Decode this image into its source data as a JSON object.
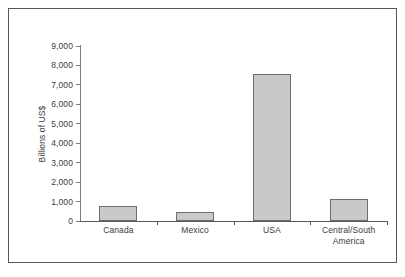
{
  "chart_data": {
    "type": "bar",
    "title": "",
    "xlabel": "",
    "ylabel": "Billions of US$",
    "categories": [
      "Canada",
      "Mexico",
      "USA",
      "Central/South America"
    ],
    "values": [
      770,
      450,
      7550,
      1130
    ],
    "ylim": [
      0,
      9000
    ],
    "yticks": [
      0,
      1000,
      2000,
      3000,
      4000,
      5000,
      6000,
      7000,
      8000,
      9000
    ],
    "ytick_labels": [
      "0",
      "1,000",
      "2,000",
      "3,000",
      "4,000",
      "5,000",
      "6,000",
      "7,000",
      "8,000",
      "9,000"
    ],
    "grid": false,
    "legend": null,
    "bar_color": "#c9c9c9",
    "bar_border_color": "#6e6e70",
    "axis_color": "#58585a",
    "text_color": "#3b3b3d"
  },
  "category_label_lines": [
    [
      "Canada"
    ],
    [
      "Mexico"
    ],
    [
      "USA"
    ],
    [
      "Central/South",
      "America"
    ]
  ]
}
